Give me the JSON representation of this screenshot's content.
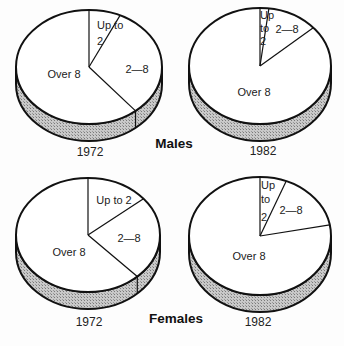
{
  "chart_data": [
    {
      "type": "pie",
      "group": "Males",
      "year": "1972",
      "categories": [
        "Up to 2",
        "2—8",
        "Over 8"
      ],
      "values": [
        7,
        32,
        61
      ],
      "geometry": {
        "cx": 89,
        "cy": 67,
        "rx": 73,
        "ry": 57,
        "depth": 17
      },
      "labels": [
        {
          "lines": [
            "Up to",
            "2"
          ],
          "x": [
            97,
            97
          ],
          "y": [
            29,
            45
          ],
          "anchor": "start"
        },
        {
          "lines": [
            "2—8"
          ],
          "x": [
            137
          ],
          "y": [
            73
          ],
          "anchor": "middle"
        },
        {
          "lines": [
            "Over 8"
          ],
          "x": [
            64
          ],
          "y": [
            78
          ],
          "anchor": "middle"
        }
      ],
      "year_label": {
        "x": 90,
        "y": 156
      }
    },
    {
      "type": "pie",
      "group": "Males",
      "year": "1982",
      "categories": [
        "Up to 2",
        "2—8",
        "Over 8"
      ],
      "values": [
        2,
        11.5,
        86.5
      ],
      "geometry": {
        "cx": 260,
        "cy": 66,
        "rx": 71,
        "ry": 58,
        "depth": 17
      },
      "labels": [
        {
          "lines": [
            "Up",
            "to",
            "2"
          ],
          "x": [
            260,
            260,
            260
          ],
          "y": [
            19,
            32,
            45
          ],
          "anchor": "start"
        },
        {
          "lines": [
            "2—8"
          ],
          "x": [
            287
          ],
          "y": [
            33
          ],
          "anchor": "middle"
        },
        {
          "lines": [
            "Over 8"
          ],
          "x": [
            254
          ],
          "y": [
            96
          ],
          "anchor": "middle"
        }
      ],
      "year_label": {
        "x": 263,
        "y": 155
      }
    },
    {
      "type": "pie",
      "group": "Females",
      "year": "1972",
      "categories": [
        "Up to 2",
        "2—8",
        "Over 8"
      ],
      "values": [
        14,
        24,
        62
      ],
      "geometry": {
        "cx": 88,
        "cy": 235,
        "rx": 72,
        "ry": 57,
        "depth": 17
      },
      "labels": [
        {
          "lines": [
            "Up to 2"
          ],
          "x": [
            114
          ],
          "y": [
            204
          ],
          "anchor": "middle"
        },
        {
          "lines": [
            "2—8"
          ],
          "x": [
            129
          ],
          "y": [
            242
          ],
          "anchor": "middle"
        },
        {
          "lines": [
            "Over 8"
          ],
          "x": [
            69
          ],
          "y": [
            256
          ],
          "anchor": "middle"
        }
      ],
      "year_label": {
        "x": 89,
        "y": 326
      }
    },
    {
      "type": "pie",
      "group": "Females",
      "year": "1982",
      "categories": [
        "Up to 2",
        "2—8",
        "Over 8"
      ],
      "values": [
        6,
        16,
        78
      ],
      "geometry": {
        "cx": 260,
        "cy": 236,
        "rx": 71,
        "ry": 59,
        "depth": 17
      },
      "labels": [
        {
          "lines": [
            "Up",
            "to",
            "2"
          ],
          "x": [
            261,
            261,
            261
          ],
          "y": [
            189,
            203,
            221
          ],
          "anchor": "start"
        },
        {
          "lines": [
            "2—8"
          ],
          "x": [
            291
          ],
          "y": [
            214
          ],
          "anchor": "middle"
        },
        {
          "lines": [
            "Over 8"
          ],
          "x": [
            249
          ],
          "y": [
            260
          ],
          "anchor": "middle"
        }
      ],
      "year_label": {
        "x": 258,
        "y": 326
      }
    }
  ],
  "group_labels": [
    {
      "text": "Males",
      "x": 174,
      "y": 148
    },
    {
      "text": "Females",
      "x": 176,
      "y": 323
    }
  ],
  "colors": {
    "outline": "#111111",
    "face": "#ffffff",
    "rim": "#bdbdbd"
  }
}
